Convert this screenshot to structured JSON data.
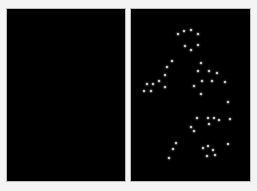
{
  "figure": {
    "panels": [
      {
        "id": "left",
        "description": "blank black field",
        "background": "#000000",
        "dots": []
      },
      {
        "id": "right",
        "description": "point-light figure",
        "background": "#000000",
        "dot_color": "#e6e6e6",
        "dots": [
          [
            177,
            33
          ],
          [
            183,
            30
          ],
          [
            190,
            29
          ],
          [
            197,
            33
          ],
          [
            184,
            45
          ],
          [
            197,
            44
          ],
          [
            190,
            49
          ],
          [
            171,
            60
          ],
          [
            166,
            66
          ],
          [
            164,
            74
          ],
          [
            158,
            80
          ],
          [
            152,
            83
          ],
          [
            146,
            83
          ],
          [
            164,
            86
          ],
          [
            143,
            90
          ],
          [
            150,
            90
          ],
          [
            200,
            62
          ],
          [
            197,
            70
          ],
          [
            208,
            70
          ],
          [
            216,
            72
          ],
          [
            201,
            80
          ],
          [
            211,
            80
          ],
          [
            224,
            81
          ],
          [
            193,
            85
          ],
          [
            200,
            93
          ],
          [
            227,
            101
          ],
          [
            196,
            117
          ],
          [
            207,
            117
          ],
          [
            213,
            117
          ],
          [
            218,
            119
          ],
          [
            229,
            118
          ],
          [
            208,
            123
          ],
          [
            190,
            126
          ],
          [
            193,
            130
          ],
          [
            227,
            143
          ],
          [
            175,
            142
          ],
          [
            172,
            148
          ],
          [
            168,
            157
          ],
          [
            202,
            147
          ],
          [
            207,
            145
          ],
          [
            212,
            149
          ],
          [
            206,
            155
          ],
          [
            214,
            154
          ]
        ]
      }
    ]
  }
}
